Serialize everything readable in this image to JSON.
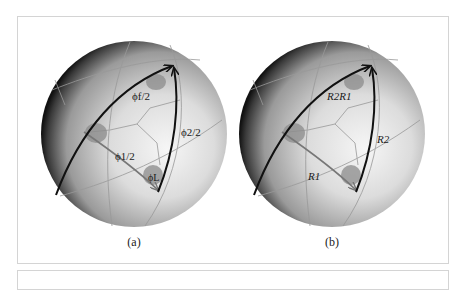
{
  "figure": {
    "panels": [
      {
        "id": "a",
        "caption": "(a)",
        "labels": {
          "top_arc": "ϕf/2",
          "right_arc": "ϕ2/2",
          "lower_arc": "ϕ1/2",
          "corner": "ϕL"
        }
      },
      {
        "id": "b",
        "caption": "(b)",
        "labels": {
          "top_arc": "R2R1",
          "right_arc": "R2",
          "lower_arc": "R1"
        }
      }
    ],
    "colors": {
      "sphere_dark": "#1a1a1a",
      "sphere_light": "#f2f2f2",
      "arc_dark": "#111111",
      "arc_gray": "#7a7a7a",
      "disk": "#8f8f8f",
      "frame": "#d4d4d4"
    }
  }
}
